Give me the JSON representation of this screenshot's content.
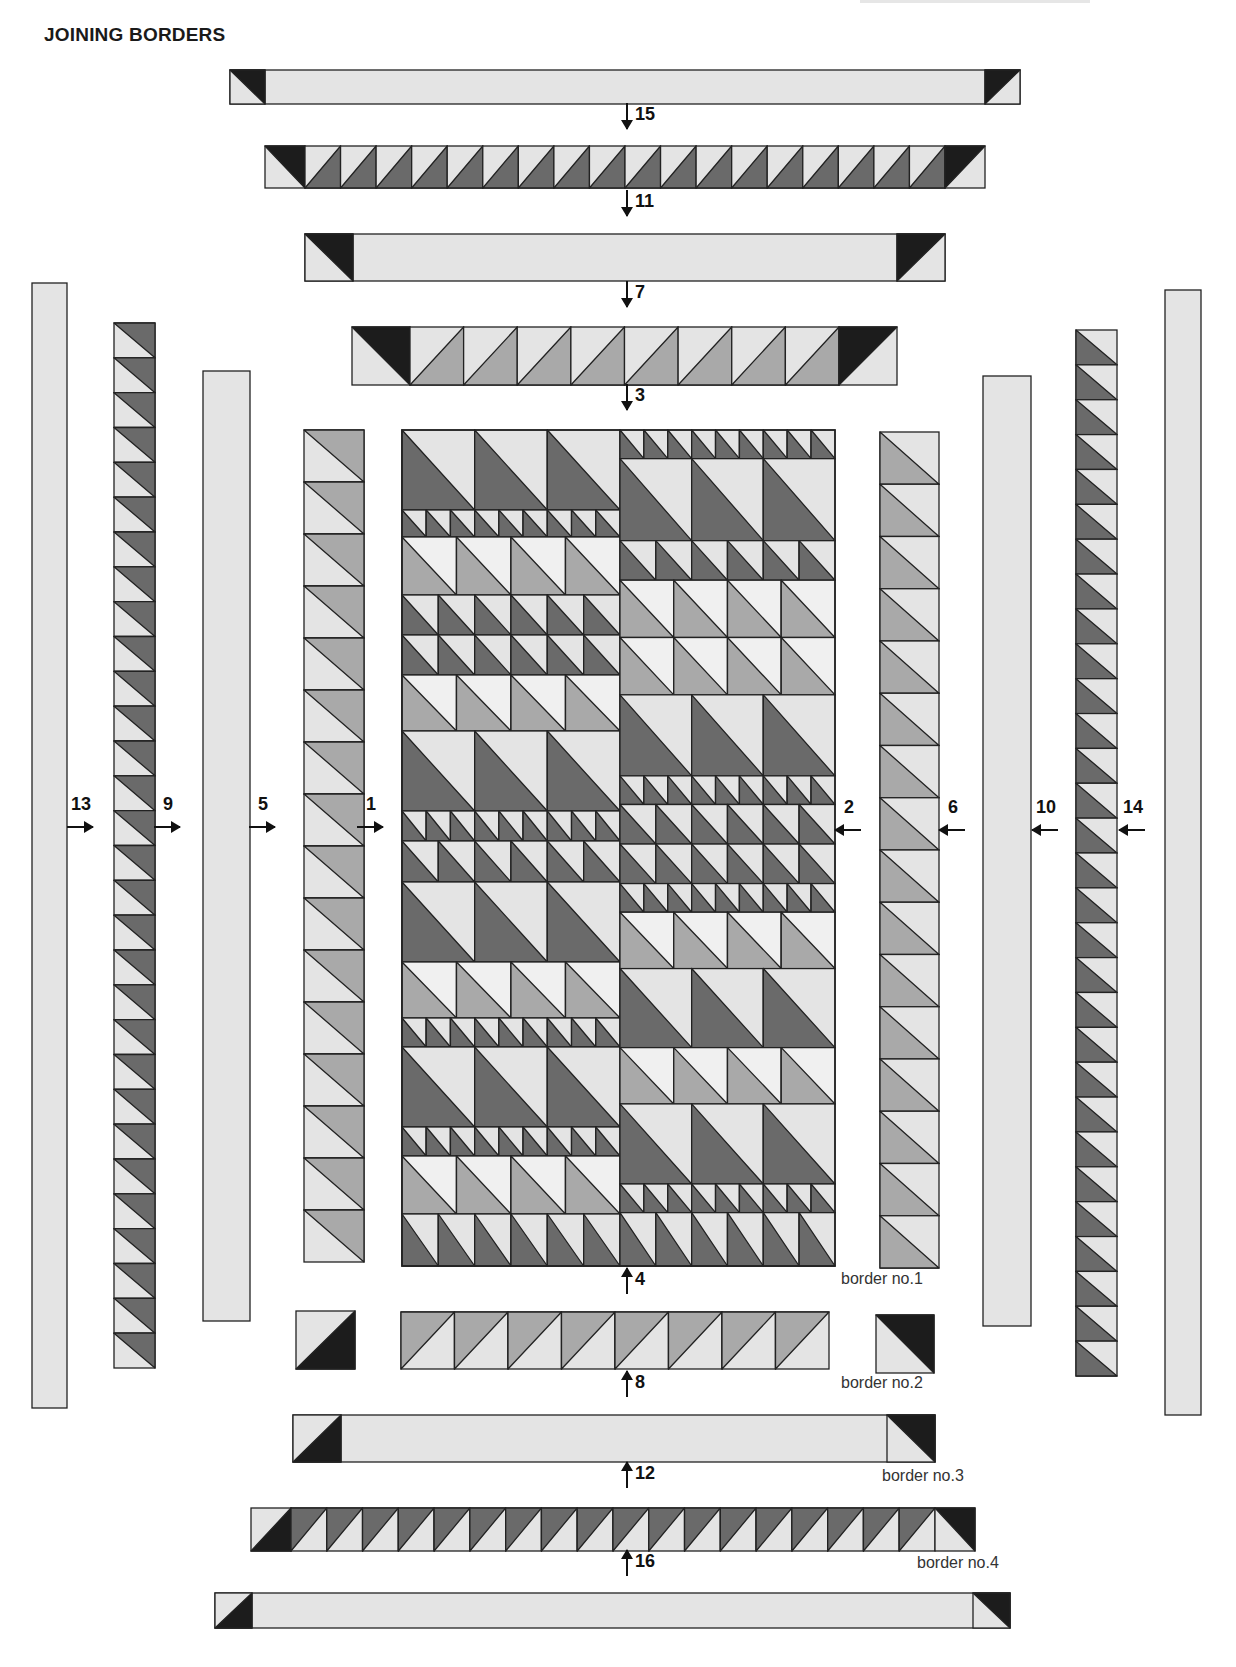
{
  "title": "JOINING BORDERS",
  "corner_text": "ᴗ ɿ ɾ ɾ ɴ ɾ",
  "colors": {
    "light": "#e4e4e4",
    "lighter": "#f0f0f0",
    "medium": "#a9a9a9",
    "dark": "#6a6a6a",
    "black": "#1c1c1c",
    "stroke": "#222222"
  },
  "border_labels": [
    {
      "text": "border no.1",
      "x": 841,
      "y": 1289
    },
    {
      "text": "border no.2",
      "x": 841,
      "y": 1393
    },
    {
      "text": "border no.3",
      "x": 882,
      "y": 1486
    },
    {
      "text": "border no.4",
      "x": 917,
      "y": 1573
    }
  ],
  "step_labels": [
    {
      "num": "15",
      "dir": "down",
      "x": 627,
      "y": 115
    },
    {
      "num": "11",
      "dir": "down",
      "x": 627,
      "y": 202
    },
    {
      "num": "7",
      "dir": "down",
      "x": 627,
      "y": 293
    },
    {
      "num": "3",
      "dir": "down",
      "x": 627,
      "y": 396
    },
    {
      "num": "4",
      "dir": "up",
      "x": 627,
      "y": 1280
    },
    {
      "num": "8",
      "dir": "up",
      "x": 627,
      "y": 1383
    },
    {
      "num": "12",
      "dir": "up",
      "x": 627,
      "y": 1474
    },
    {
      "num": "16",
      "dir": "up",
      "x": 627,
      "y": 1562
    },
    {
      "num": "13",
      "dir": "right",
      "x": 80,
      "y": 827
    },
    {
      "num": "9",
      "dir": "right",
      "x": 167,
      "y": 827
    },
    {
      "num": "5",
      "dir": "right",
      "x": 262,
      "y": 827
    },
    {
      "num": "1",
      "dir": "right",
      "x": 370,
      "y": 827
    },
    {
      "num": "2",
      "dir": "left",
      "x": 848,
      "y": 830
    },
    {
      "num": "6",
      "dir": "left",
      "x": 952,
      "y": 830
    },
    {
      "num": "10",
      "dir": "left",
      "x": 1045,
      "y": 830
    },
    {
      "num": "14",
      "dir": "left",
      "x": 1132,
      "y": 830
    }
  ],
  "horizontal_strips": [
    {
      "step": "15-top-plain",
      "x": 230,
      "y": 70,
      "w": 790,
      "h": 34,
      "type": "plain",
      "corner_w": 35,
      "corner_left": "black-tr-left",
      "corner_right": "black-tl-right"
    },
    {
      "step": "15",
      "x": 265,
      "y": 146,
      "w": 720,
      "h": 42,
      "type": "hst",
      "count": 18,
      "unit_fill": "dark",
      "unit_orient": "br",
      "corner_w": 40,
      "corner_left": "black-tr",
      "corner_right": "black-tl"
    },
    {
      "step": "11",
      "x": 305,
      "y": 234,
      "w": 640,
      "h": 47,
      "type": "plain",
      "corner_w": 48,
      "corner_left": "black-tr",
      "corner_right": "black-tl"
    },
    {
      "step": "7",
      "x": 352,
      "y": 327,
      "w": 545,
      "h": 58,
      "type": "hst",
      "count": 8,
      "unit_fill": "medium",
      "unit_orient": "br",
      "corner_w": 58,
      "corner_left": "black-tr",
      "corner_right": "black-tl"
    },
    {
      "step": "4",
      "x": 401,
      "y": 1312,
      "w": 428,
      "h": 57,
      "type": "hst",
      "count": 8,
      "unit_fill": "medium",
      "unit_orient": "tl",
      "corner_w": 0
    },
    {
      "step": "8",
      "x": 293,
      "y": 1415,
      "w": 642,
      "h": 47,
      "type": "plain",
      "corner_w": 48,
      "corner_left": "black-br",
      "corner_right": "black-tr2"
    },
    {
      "step": "12",
      "x": 251,
      "y": 1508,
      "w": 724,
      "h": 43,
      "type": "hst",
      "count": 18,
      "unit_fill": "dark",
      "unit_orient": "tl",
      "corner_w": 40,
      "corner_left": "black-br",
      "corner_right": "black-tr2"
    },
    {
      "step": "16",
      "x": 215,
      "y": 1593,
      "w": 795,
      "h": 35,
      "type": "plain",
      "corner_w": 37,
      "corner_left": "black-br",
      "corner_right": "black-tr2"
    }
  ],
  "corner_squares": [
    {
      "name": "border1-left-corner",
      "x": 296,
      "y": 1311,
      "w": 59,
      "h": 58,
      "style": "black-br"
    },
    {
      "name": "border1-right-corner",
      "x": 876,
      "y": 1315,
      "w": 58,
      "h": 58,
      "style": "black-tr2"
    }
  ],
  "vertical_strips": [
    {
      "step": "13",
      "x": 32,
      "y": 283,
      "w": 35,
      "h": 1125,
      "type": "plain"
    },
    {
      "step": "13-hst",
      "x": 114,
      "y": 323,
      "w": 41,
      "h": 1045,
      "type": "hst",
      "count": 30,
      "unit_fill": "dark",
      "unit_orient": "tr"
    },
    {
      "step": "9",
      "x": 203,
      "y": 371,
      "w": 47,
      "h": 950,
      "type": "plain"
    },
    {
      "step": "5",
      "x": 304,
      "y": 430,
      "w": 60,
      "h": 832,
      "type": "hst",
      "count": 16,
      "unit_fill": "medium",
      "unit_orient": "tr"
    },
    {
      "step": "2",
      "x": 880,
      "y": 432,
      "w": 59,
      "h": 836,
      "type": "hst",
      "count": 16,
      "unit_fill": "medium",
      "unit_orient": "bl"
    },
    {
      "step": "6",
      "x": 983,
      "y": 376,
      "w": 48,
      "h": 950,
      "type": "plain"
    },
    {
      "step": "10-hst",
      "x": 1076,
      "y": 330,
      "w": 41,
      "h": 1046,
      "type": "hst",
      "count": 30,
      "unit_fill": "dark",
      "unit_orient": "bl"
    },
    {
      "step": "14",
      "x": 1165,
      "y": 290,
      "w": 36,
      "h": 1125,
      "type": "plain"
    }
  ],
  "center": {
    "x": 402,
    "y": 430,
    "w": 433,
    "h": 836,
    "split_x": 620,
    "left_rows": [
      {
        "h": 80,
        "kind": "big"
      },
      {
        "h": 27,
        "kind": "small"
      },
      {
        "h": 58,
        "kind": "medium"
      },
      {
        "h": 40,
        "kind": "darkmed"
      },
      {
        "h": 40,
        "kind": "darkmed"
      },
      {
        "h": 56,
        "kind": "medium"
      },
      {
        "h": 80,
        "kind": "big"
      },
      {
        "h": 30,
        "kind": "small"
      },
      {
        "h": 41,
        "kind": "darkmed"
      },
      {
        "h": 80,
        "kind": "big"
      },
      {
        "h": 56,
        "kind": "medium"
      },
      {
        "h": 29,
        "kind": "small"
      },
      {
        "h": 80,
        "kind": "big"
      },
      {
        "h": 29,
        "kind": "small"
      },
      {
        "h": 58,
        "kind": "medium"
      },
      {
        "h": 52,
        "kind": "darkmed"
      }
    ],
    "right_rows": [
      {
        "h": 29,
        "kind": "small"
      },
      {
        "h": 83,
        "kind": "big"
      },
      {
        "h": 40,
        "kind": "darkmed"
      },
      {
        "h": 58,
        "kind": "medium"
      },
      {
        "h": 58,
        "kind": "medium"
      },
      {
        "h": 82,
        "kind": "big"
      },
      {
        "h": 29,
        "kind": "small"
      },
      {
        "h": 40,
        "kind": "darkmed"
      },
      {
        "h": 40,
        "kind": "darkmed"
      },
      {
        "h": 29,
        "kind": "small"
      },
      {
        "h": 57,
        "kind": "medium"
      },
      {
        "h": 80,
        "kind": "big"
      },
      {
        "h": 57,
        "kind": "medium"
      },
      {
        "h": 81,
        "kind": "big"
      },
      {
        "h": 29,
        "kind": "small"
      },
      {
        "h": 54,
        "kind": "darkmed"
      }
    ],
    "row_kinds": {
      "big": {
        "count": 3,
        "fill": "dark",
        "bg": "light"
      },
      "small": {
        "count": 9,
        "fill": "dark",
        "bg": "light"
      },
      "medium": {
        "count": 4,
        "fill": "medium",
        "bg": "lighter"
      },
      "darkmed": {
        "count": 6,
        "fill": "dark",
        "bg": "light"
      }
    }
  }
}
